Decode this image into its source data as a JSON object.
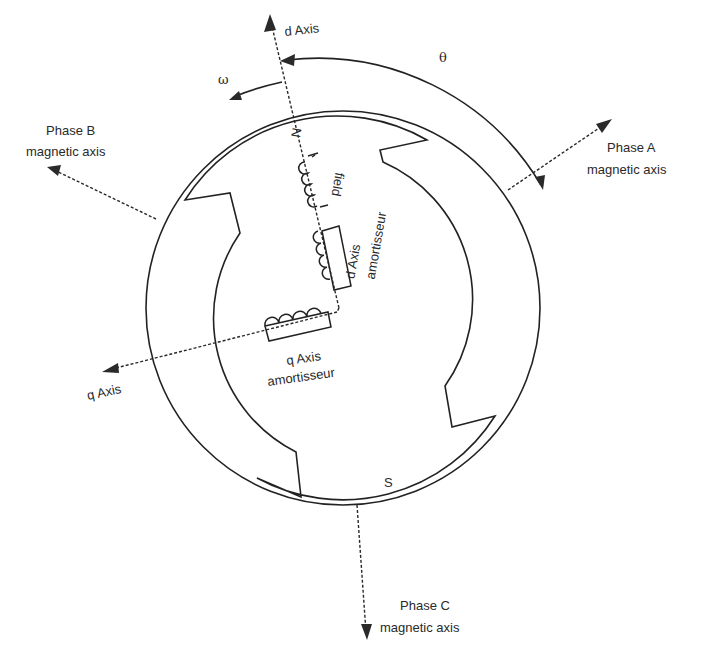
{
  "diagram": {
    "colors": {
      "stroke": "#222222",
      "background": "#ffffff"
    },
    "axes": {
      "d_axis": "d Axis",
      "q_axis": "q Axis",
      "phase_a": {
        "line1": "Phase A",
        "line2": "magnetic axis"
      },
      "phase_b": {
        "line1": "Phase B",
        "line2": "magnetic axis"
      },
      "phase_c": {
        "line1": "Phase C",
        "line2": "magnetic axis"
      }
    },
    "symbols": {
      "theta": "θ",
      "omega": "ω"
    },
    "poles": {
      "north": "N",
      "south": "S"
    },
    "windings": {
      "field": "field",
      "d_amortisseur": {
        "line1": "d Axis",
        "line2": "amortisseur"
      },
      "q_amortisseur": {
        "line1": "q Axis",
        "line2": "amortisseur"
      }
    }
  }
}
